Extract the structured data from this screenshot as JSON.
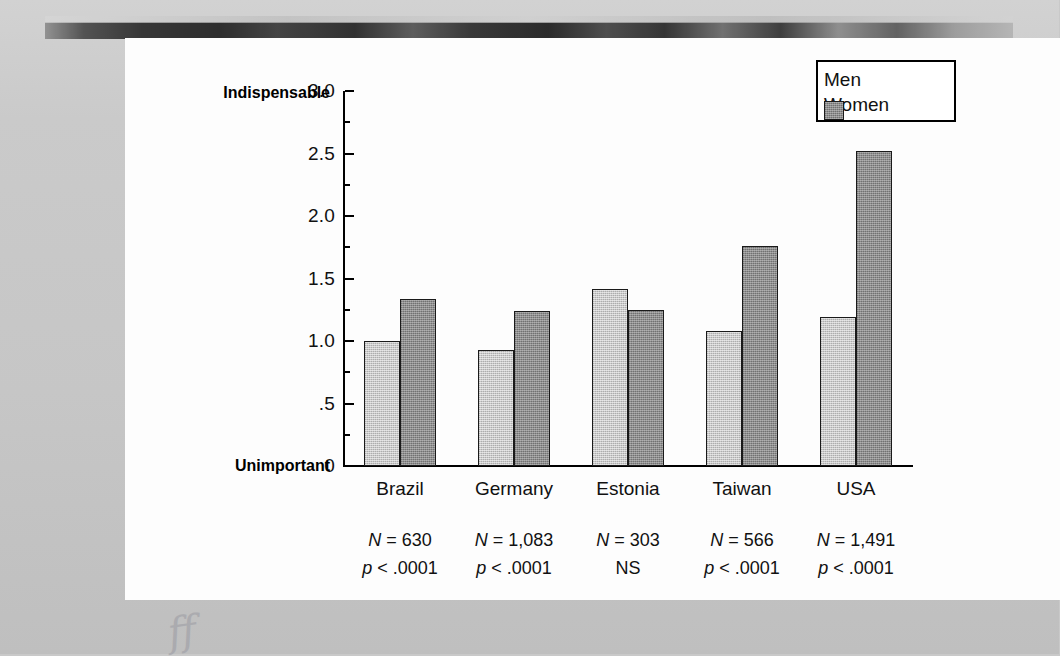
{
  "chart_data": {
    "type": "bar",
    "title": "",
    "xlabel": "",
    "ylabel": "",
    "ylim": [
      0,
      3.0
    ],
    "grid": false,
    "legend_position": "top-right",
    "categories": [
      "Brazil",
      "Germany",
      "Estonia",
      "Taiwan",
      "USA"
    ],
    "series": [
      {
        "name": "Men",
        "values": [
          1.0,
          0.93,
          1.42,
          1.08,
          1.19
        ]
      },
      {
        "name": "Women",
        "values": [
          1.34,
          1.24,
          1.25,
          1.76,
          2.52
        ]
      }
    ],
    "y_ticks": [
      "0",
      ".5",
      "1.0",
      "1.5",
      "2.0",
      "2.5",
      "3.0"
    ],
    "y_tick_values": [
      0,
      0.5,
      1.0,
      1.5,
      2.0,
      2.5,
      3.0
    ],
    "axis_end_labels": {
      "top": "Indispensable",
      "bottom": "Unimportant"
    },
    "annotations": [
      {
        "category": "Brazil",
        "n": "N = 630",
        "p": "p < .0001"
      },
      {
        "category": "Germany",
        "n": "N = 1,083",
        "p": "p < .0001"
      },
      {
        "category": "Estonia",
        "n": "N = 303",
        "p": "NS"
      },
      {
        "category": "Taiwan",
        "n": "N = 566",
        "p": "p < .0001"
      },
      {
        "category": "USA",
        "n": "N = 1,491",
        "p": "p < .0001"
      }
    ]
  },
  "legend": {
    "items": [
      {
        "label": "Men",
        "color": "#c9c9c9"
      },
      {
        "label": "Women",
        "color": "#8d8d8d"
      }
    ]
  },
  "axis": {
    "top_label": "Indispensable",
    "bottom_label": "Unimportant",
    "ticks": [
      {
        "label": "3.0",
        "value": 3.0
      },
      {
        "label": "2.5",
        "value": 2.5
      },
      {
        "label": "2.0",
        "value": 2.0
      },
      {
        "label": "1.5",
        "value": 1.5
      },
      {
        "label": "1.0",
        "value": 1.0
      },
      {
        "label": ".5",
        "value": 0.5
      },
      {
        "label": "0",
        "value": 0.0
      }
    ]
  },
  "categories": [
    {
      "name": "Brazil",
      "n": "N = 630",
      "p": "p < .0001"
    },
    {
      "name": "Germany",
      "n": "N = 1,083",
      "p": "p < .0001"
    },
    {
      "name": "Estonia",
      "n": "N = 303",
      "p": "NS"
    },
    {
      "name": "Taiwan",
      "n": "N = 566",
      "p": "p < .0001"
    },
    {
      "name": "USA",
      "n": "N = 1,491",
      "p": "p < .0001"
    }
  ],
  "colors": {
    "men": "#c9c9c9",
    "women": "#8d8d8d",
    "axis": "#000000",
    "panel": "#fdfdfd",
    "page": "#c9c9c9"
  },
  "handwriting": "ff"
}
